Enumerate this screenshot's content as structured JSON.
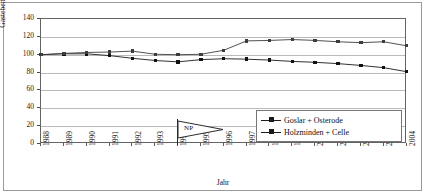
{
  "chart_data": {
    "type": "line",
    "title": "",
    "xlabel": "Jahr",
    "ylabel": "Gästebetten (Index)",
    "categories": [
      "1988",
      "1989",
      "1990",
      "1991",
      "1992",
      "1993",
      "1994",
      "1995",
      "1996",
      "1997",
      "1998",
      "1999",
      "2000",
      "2001",
      "2002",
      "2003",
      "2004"
    ],
    "ylim": [
      0,
      140
    ],
    "ytick_labels": [
      "0",
      "20",
      "40",
      "60",
      "80",
      "100",
      "120",
      "140"
    ],
    "yticks": [
      0,
      20,
      40,
      60,
      80,
      100,
      120,
      140
    ],
    "grid": "horizontal",
    "legend_position": "inside-bottom-right",
    "series": [
      {
        "name": "Goslar + Osterode",
        "marker": "diamond",
        "values": [
          100,
          101,
          101,
          99,
          96,
          93.5,
          92,
          94.5,
          95.5,
          95,
          94,
          92.5,
          91.5,
          90,
          88,
          85.5,
          81
        ]
      },
      {
        "name": "Holzminden + Celle",
        "marker": "square",
        "values": [
          100,
          101.5,
          102.5,
          103,
          104,
          100.5,
          100,
          100.5,
          105,
          115.5,
          116,
          117,
          116,
          114.5,
          113.5,
          114.5,
          110
        ]
      }
    ],
    "annotations": [
      {
        "label": "NP",
        "at_category": "1994",
        "kind": "flag-marker"
      }
    ]
  },
  "axis": {
    "y_title": "Gästebetten (Index)",
    "x_title": "Jahr"
  },
  "legend": {
    "items": [
      {
        "label": "Goslar + Osterode"
      },
      {
        "label": "Holzminden + Celle"
      }
    ]
  },
  "colors": {
    "series_1": "#1b1b1b",
    "series_2": "#3d3d3d",
    "gridline": "#b9b9b9",
    "frame": "#636363",
    "background": "#ffffff"
  }
}
